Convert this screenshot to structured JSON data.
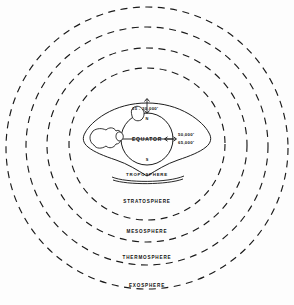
{
  "diagram": {
    "globe": {
      "equator_label": "EQUATOR",
      "north_pole_label": "N",
      "south_pole_label": "S"
    },
    "altitudes": {
      "polar": "25 - 30,000'",
      "equatorial_lower": "50,000'",
      "equatorial_upper": "65,000'"
    },
    "layers": [
      {
        "name": "TROPOSPHERE"
      },
      {
        "name": "STRATOSPHERE"
      },
      {
        "name": "MESOSPHERE"
      },
      {
        "name": "THERMOSPHERE"
      },
      {
        "name": "EXOSPHERE"
      }
    ],
    "colors": {
      "ink": "#111111",
      "ring": "#1a1a1a",
      "background": "#fdfdfd"
    }
  }
}
